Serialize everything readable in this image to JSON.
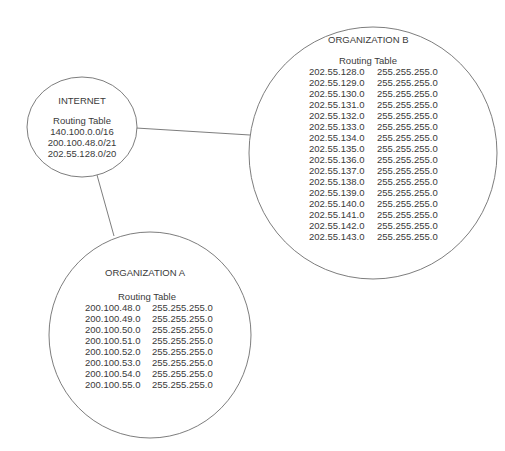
{
  "internet": {
    "title": "INTERNET",
    "table_title": "Routing Table",
    "routes": [
      "140.100.0.0/16",
      "200.100.48.0/21",
      "202.55.128.0/20"
    ]
  },
  "org_a": {
    "title": "ORGANIZATION A",
    "table_title": "Routing Table",
    "routes": [
      {
        "network": "200.100.48.0",
        "mask": "255.255.255.0"
      },
      {
        "network": "200.100.49.0",
        "mask": "255.255.255.0"
      },
      {
        "network": "200.100.50.0",
        "mask": "255.255.255.0"
      },
      {
        "network": "200.100.51.0",
        "mask": "255.255.255.0"
      },
      {
        "network": "200.100.52.0",
        "mask": "255.255.255.0"
      },
      {
        "network": "200.100.53.0",
        "mask": "255.255.255.0"
      },
      {
        "network": "200.100.54.0",
        "mask": "255.255.255.0"
      },
      {
        "network": "200.100.55.0",
        "mask": "255.255.255.0"
      }
    ]
  },
  "org_b": {
    "title": "ORGANIZATION B",
    "table_title": "Routing Table",
    "routes": [
      {
        "network": "202.55.128.0",
        "mask": "255.255.255.0"
      },
      {
        "network": "202.55.129.0",
        "mask": "255.255.255.0"
      },
      {
        "network": "202.55.130.0",
        "mask": "255.255.255.0"
      },
      {
        "network": "202.55.131.0",
        "mask": "255.255.255.0"
      },
      {
        "network": "202.55.132.0",
        "mask": "255.255.255.0"
      },
      {
        "network": "202.55.133.0",
        "mask": "255.255.255.0"
      },
      {
        "network": "202.55.134.0",
        "mask": "255.255.255.0"
      },
      {
        "network": "202.55.135.0",
        "mask": "255.255.255.0"
      },
      {
        "network": "202.55.136.0",
        "mask": "255.255.255.0"
      },
      {
        "network": "202.55.137.0",
        "mask": "255.255.255.0"
      },
      {
        "network": "202.55.138.0",
        "mask": "255.255.255.0"
      },
      {
        "network": "202.55.139.0",
        "mask": "255.255.255.0"
      },
      {
        "network": "202.55.140.0",
        "mask": "255.255.255.0"
      },
      {
        "network": "202.55.141.0",
        "mask": "255.255.255.0"
      },
      {
        "network": "202.55.142.0",
        "mask": "255.255.255.0"
      },
      {
        "network": "202.55.143.0",
        "mask": "255.255.255.0"
      }
    ]
  },
  "colors": {
    "stroke": "#6e6e6e",
    "text": "#3a3a3a"
  }
}
